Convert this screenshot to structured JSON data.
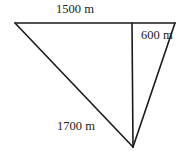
{
  "diagram": {
    "type": "geometry-triangle",
    "vertices": {
      "top_left": {
        "x": 15,
        "y": 23
      },
      "top_right": {
        "x": 175,
        "y": 23
      },
      "foot_of_vertical": {
        "x": 132,
        "y": 23
      },
      "bottom": {
        "x": 133,
        "y": 147
      }
    },
    "labels": {
      "top_side": "1500 m",
      "right_side": "600 m",
      "left_side": "1700 m"
    },
    "colors": {
      "line": "#1a1a1a",
      "text": "#222222",
      "background": "#ffffff"
    }
  }
}
